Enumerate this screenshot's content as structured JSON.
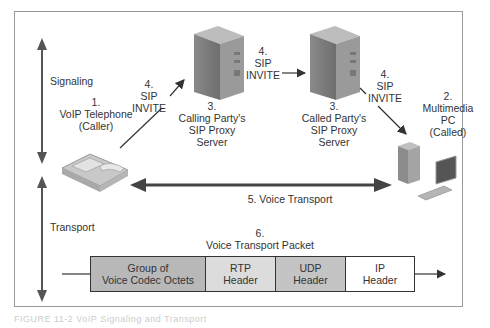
{
  "diagram": {
    "title": "VoIP Signaling and Transport",
    "layers": {
      "signaling": "Signaling",
      "transport": "Transport"
    },
    "nodes": {
      "caller": {
        "num": "1.",
        "line1": "VoIP Telephone",
        "line2": "(Caller)"
      },
      "called": {
        "num": "2.",
        "line1": "Multimedia",
        "line2": "PC",
        "line3": "(Called)"
      },
      "calling_proxy": {
        "num": "3.",
        "line1": "Calling Party's",
        "line2": "SIP Proxy",
        "line3": "Server"
      },
      "called_proxy": {
        "num": "3.",
        "line1": "Called Party's",
        "line2": "SIP Proxy",
        "line3": "Server"
      }
    },
    "messages": {
      "invite1": {
        "num": "4.",
        "line1": "SIP",
        "line2": "INVITE"
      },
      "invite2": {
        "num": "4.",
        "line1": "SIP",
        "line2": "INVITE"
      },
      "invite3": {
        "num": "4.",
        "line1": "SIP",
        "line2": "INVITE"
      },
      "voice_transport": "5. Voice Transport"
    },
    "packet": {
      "num": "6.",
      "label": "Voice Transport Packet",
      "fields": [
        {
          "line1": "Group of",
          "line2": "Voice Codec Octets",
          "color": "#b8b8b8"
        },
        {
          "line1": "RTP",
          "line2": "Header",
          "color": "#dcdcdc"
        },
        {
          "line1": "UDP",
          "line2": "Header",
          "color": "#c4c4c4"
        },
        {
          "line1": "IP",
          "line2": "Header",
          "color": "#ffffff"
        }
      ]
    },
    "caption": "FIGURE 11-2 VoIP Signaling and Transport"
  }
}
